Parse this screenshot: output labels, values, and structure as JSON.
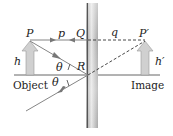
{
  "diagram": {
    "labels": {
      "P": "P",
      "p": "p",
      "Q": "Q",
      "q": "q",
      "P_prime": "P′",
      "R": "R",
      "h": "h",
      "h_prime": "h′",
      "theta_incident": "θ",
      "theta_reflected": "θ",
      "object": "Object",
      "image": "Image"
    },
    "colors": {
      "ray": "#777777",
      "arrow_fill": "#cfcfcf",
      "mirror": "#b8b8b8",
      "text": "#222222"
    }
  }
}
